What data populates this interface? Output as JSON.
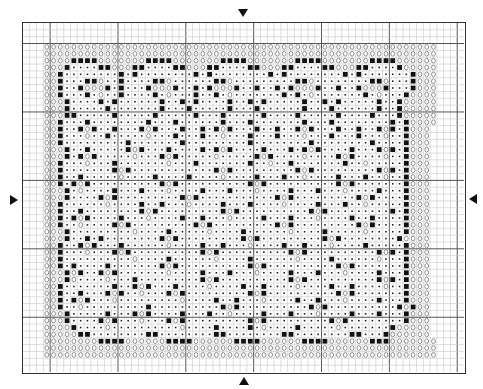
{
  "chart": {
    "cols": 65,
    "rows": 51,
    "major_every": 10,
    "major_offset_x": 4,
    "major_offset_y": 3,
    "colors": {
      "grid_minor": "#c8c8c8",
      "grid_major": "#555555",
      "border": "#333333",
      "square": "#111111",
      "dot": "#222222",
      "circle": "#777777"
    },
    "legend_symbols": {
      "o": "circle-stitch",
      ".": "dot-stitch",
      "#": "filled-square-stitch",
      " ": "empty"
    },
    "center_markers": [
      "arrow-top",
      "arrow-bottom",
      "arrow-left",
      "arrow-right"
    ]
  },
  "chart_data": {
    "type": "heatmap",
    "xlabel": "",
    "ylabel": "",
    "symbols": {
      "o": "circle",
      ".": "dot",
      "#": "filled square",
      " ": "blank"
    },
    "grid": [
      "                                                                 ",
      "                                                                 ",
      "                                                                 ",
      "   oooooooooooooooooooooooooooooooooooooooooooooooooooooooooo    ",
      "   oooooooooooooooooooooooooooooooooooooooooooooooooooooooooo    ",
      "   oooo####ooooooo####ooooooo####ooooooo####ooooooo####oooooo    ",
      "   ooo#....##ooo##....##ooo##....##ooo##....##ooo##....#ooooo    ",
      "   oo#........#.#........#.#........#.#........#.#.......#ooo    ",
      "   oo#...##o..#....##o......##o.........##o........##o...#ooo    ",
      "   oo#..#ooo#.#...#ooo#..#.#ooo#..#..#.#ooo#..#..#ooo#...#ooo    ",
      "   oo#...#.o..#....#.o...#..#.o.......#.#.o.......#.o...#oooo    ",
      "   ooo#....#.#......#..#.#....#..#.#.....#..#.#.....#..#ooooo    ",
      "   ooo#.....#.......#...#.....#...#......#...#......#..#ooooo    ",
      "   ooo##.....#.....#.....#...#.....#....#.....#....#...#ooooo    ",
      "   oo#...#........#...#......#...#.......#...#........#.#oooo    ",
      "   oo#..#o#..#...#o#...#..#.#o#...#..#..#o#...#..#..#o#.#ooo    ",
      "   oo#...o..#.....o...#...#..o...#...#...o...#...#...o..#ooo    ",
      "   oo#.........#.......#.........#........#........#....#ooo    ",
      "   ooo#..#.....#o#...#....#.#o#....#...#.#o#....#...#o#.#ooo    ",
      "   ooo#.#o#.....o...#o#.....o.....#o#....o....#o#....o..#ooo    ",
      "   oo#...o...#.......o...#.......#..o..#.......#..o.....#ooo    ",
      "   oo#.......#o#............#o#.........#o#.........#o#.#ooo    ",
      "   oo#..#.....o....#....#....o....#...#..o....#...#..o..#ooo    ",
      "   oo#.#o#..........#o#..........#o#..........#o#.......#ooo    ",
      "   ooo#.o....#...#...o....#...#...o....#...#...o....#...#ooo    ",
      "   ooo#....#o#.........#o#...........#o#.........#o#....#ooo    ",
      "   oo#......o....#..#...o....#...#....o....#...#..o.....#ooo    ",
      "   oo#..#........#o#.........#o#..........#o#.........#.#ooo    ",
      "   oo#.#o#....#...o....#..#...o....#...#...o....#..#....#ooo    ",
      "   oo#..o....#o#.........#o#.........#o#.........#o#....#ooo    ",
      "   ooo#.........o....#.....o....#......o....#.....o.....#ooo    ",
      "   ooo#..#.#........#o#.........#o#.........#o#........#oooo    ",
      "   oo#..#o#...#......o....#..#...o....#..#...o....#.....#ooo    ",
      "   oo#...o...#o#..........#o#..........#o#..........#o#.#ooo    ",
      "   oo#..........o....#......o....#......o....#......o...#ooo    ",
      "   oo#.#....#.......#o#..........#o#..........#o#.......#ooo    ",
      "   ooo#o#..#o#.......o....#...#...o....#...#...o....#...#ooo    ",
      "   ooo#o....o...#.........#o#..........#o#..........#o#.#ooo    ",
      "   oo#.......#..#o#...#....o....#..#....o....#..#....o..#ooo    ",
      "   oo#..#...#o#..o...#o#.........#o#..........#o#.......#ooo    ",
      "   oo#.#o#...o.........o....#..#...o....#..#...o....#...#ooo    ",
      "   oo#..o.........#..........#o#..........#o#..........#o#oo    ",
      "   ooo#.....#...#o#....#...#..o....#...#...o....#...#...#ooo    ",
      "   ooo#....#o#...o...#o#.........#o#.........#o#........#ooo    ",
      "   oooo#....o..........o....#....#.o....#.....o.......#ooooo    ",
      "   ooooo##........##........##........##........##...#oooooo    ",
      "   oooooooo####oooooo####oooooo####oooooo####oooooo###ooooooo    ",
      "   oooooooooooooooooooooooooooooooooooooooooooooooooooooooooo    ",
      "   oooooooooooooooooooooooooooooooooooooooooooooooooooooooooo    ",
      "                                                                 ",
      "                                                                 "
    ]
  }
}
